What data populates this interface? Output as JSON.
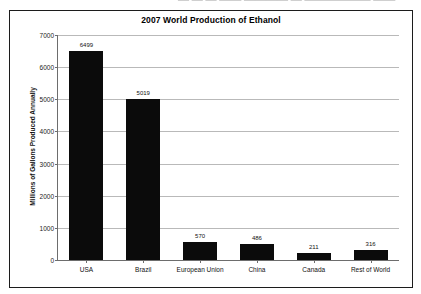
{
  "page": {
    "top_cropped_text": "— — —  —— ———— — —————— ——"
  },
  "chart_data": {
    "type": "bar",
    "title": "2007 World Production of Ethanol",
    "xlabel": "",
    "ylabel": "Millions of Gallons Produced Annually",
    "categories": [
      "USA",
      "Brazil",
      "European Union",
      "China",
      "Canada",
      "Rest of World"
    ],
    "values": [
      6499,
      5019,
      570,
      486,
      211,
      316
    ],
    "value_labels": [
      "6499",
      "5019",
      "570",
      "486",
      "211",
      "316"
    ],
    "ylim": [
      0,
      7000
    ],
    "yticks": [
      0,
      1000,
      2000,
      3000,
      4000,
      5000,
      6000,
      7000
    ],
    "ytick_labels": [
      "0",
      "1000",
      "2000",
      "3000",
      "4000",
      "5000",
      "6000",
      "7000"
    ],
    "grid": true,
    "legend": false,
    "bar_color": "#0b0b0b",
    "gridline_color": "#b9b9b9",
    "axis_color": "#6d6d6d",
    "frame_color": "#1c1c1c",
    "background": "#ffffff"
  }
}
